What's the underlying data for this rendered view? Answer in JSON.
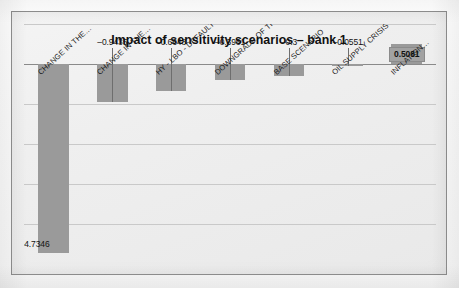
{
  "chart_data": {
    "type": "bar",
    "title": "Impact of sensitivity scenarios – bank 1",
    "xlabel": "",
    "ylabel": "",
    "grid": true,
    "legend": "none",
    "orientation": "vertical",
    "axis_ticks_visible": false,
    "ylim": [
      -5.0,
      1.0
    ],
    "baseline": 0,
    "categories": [
      "CHANGE IN THE…",
      "CHANGE IN THE…",
      "HY - LBO - DEFAULT …",
      "DOWNGRADE OF THE…",
      "BASE SCENARIO",
      "OIL SUPPLY CRISIS",
      "INFLATION…"
    ],
    "values": [
      -4.7346,
      -0.9435,
      -0.6648,
      -0.3961,
      -0.3,
      -0.0551,
      0.5081
    ],
    "value_labels": [
      "–4.7346",
      "–0.9435",
      "–0.6648",
      "–0.3961",
      "–0.3",
      "–0.0551",
      "0.5081"
    ],
    "highlighted_index": 6,
    "bar_color": "#9a9a9a",
    "highlight_label_bg": "#a2a2a2",
    "plot_bg": "#efefef",
    "axis_color": "#8a8a8a",
    "grid_color": "#c9c9c9"
  },
  "chart": {
    "title": "Impact of sensitivity scenarios – bank 1"
  }
}
